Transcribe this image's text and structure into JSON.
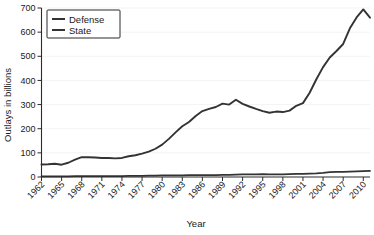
{
  "chart_data": {
    "type": "line",
    "title": "",
    "xlabel": "Year",
    "ylabel": "Outlays in billions",
    "xlim": [
      1962,
      2011
    ],
    "ylim": [
      0,
      700
    ],
    "yticks": [
      0,
      100,
      200,
      300,
      400,
      500,
      600,
      700
    ],
    "ytick_labels": [
      "0",
      "100",
      "200",
      "300",
      "400",
      "500",
      "600",
      "700"
    ],
    "xticks": [
      1962,
      1965,
      1968,
      1971,
      1974,
      1977,
      1980,
      1983,
      1986,
      1989,
      1992,
      1995,
      1998,
      2001,
      2004,
      2007,
      2010
    ],
    "xtick_labels": [
      "1962",
      "1965",
      "1968",
      "1971",
      "1974",
      "1977",
      "1980",
      "1983",
      "1986",
      "1989",
      "1992",
      "1995",
      "1998",
      "2001",
      "2004",
      "2007",
      "2010"
    ],
    "grid": true,
    "grid_axis": "y",
    "legend_position": "upper-left",
    "x": [
      1962,
      1963,
      1964,
      1965,
      1966,
      1967,
      1968,
      1969,
      1970,
      1971,
      1972,
      1973,
      1974,
      1975,
      1976,
      1977,
      1978,
      1979,
      1980,
      1981,
      1982,
      1983,
      1984,
      1985,
      1986,
      1987,
      1988,
      1989,
      1990,
      1991,
      1992,
      1993,
      1994,
      1995,
      1996,
      1997,
      1998,
      1999,
      2000,
      2001,
      2002,
      2003,
      2004,
      2005,
      2006,
      2007,
      2008,
      2009,
      2010,
      2011
    ],
    "series": [
      {
        "name": "Defense",
        "color": "#333333",
        "values": [
          52,
          53,
          55,
          51,
          59,
          72,
          82,
          82,
          81,
          79,
          79,
          77,
          79,
          86,
          90,
          97,
          105,
          117,
          134,
          158,
          185,
          210,
          228,
          253,
          273,
          282,
          290,
          304,
          300,
          320,
          303,
          292,
          282,
          273,
          266,
          271,
          269,
          275,
          295,
          306,
          349,
          405,
          455,
          495,
          522,
          551,
          616,
          661,
          694,
          700
        ],
        "values_plotted": [
          52,
          53,
          55,
          51,
          59,
          72,
          82,
          82,
          81,
          79,
          79,
          77,
          79,
          86,
          90,
          97,
          105,
          117,
          134,
          158,
          185,
          210,
          228,
          253,
          273,
          282,
          290,
          304,
          300,
          320,
          303,
          292,
          282,
          273,
          266,
          271,
          269,
          275,
          295,
          306,
          349,
          405,
          455,
          495,
          522,
          551,
          616,
          661,
          694,
          660
        ]
      },
      {
        "name": "State",
        "color": "#333333",
        "values": [
          3,
          3,
          3,
          3,
          3,
          4,
          4,
          4,
          4,
          4,
          4,
          4,
          4,
          5,
          5,
          5,
          6,
          6,
          7,
          7,
          7,
          7,
          8,
          8,
          8,
          8,
          8,
          9,
          9,
          10,
          11,
          11,
          11,
          12,
          11,
          11,
          11,
          12,
          13,
          13,
          14,
          15,
          17,
          20,
          21,
          21,
          22,
          23,
          24,
          25
        ]
      }
    ]
  },
  "legend": {
    "entries": [
      {
        "label": "Defense"
      },
      {
        "label": "State"
      }
    ]
  },
  "axis_titles": {
    "x": "Year",
    "y": "Outlays in billions"
  }
}
